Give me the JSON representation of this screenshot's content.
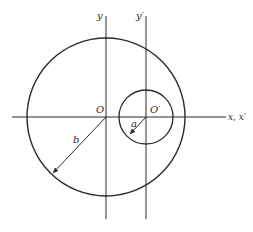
{
  "diagram": {
    "labels": {
      "y_axis": "y",
      "y_prime_axis": "y′",
      "origin": "O",
      "origin_prime": "O′",
      "x_axes": "x, x′",
      "radius_small": "a",
      "radius_large": "b"
    },
    "large_circle": {
      "cx": 106,
      "cy": 117,
      "r": 79
    },
    "small_circle": {
      "cx": 146,
      "cy": 117,
      "r": 27
    },
    "colors": {
      "stroke": "#2a2a2a",
      "background": "#ffffff"
    }
  }
}
